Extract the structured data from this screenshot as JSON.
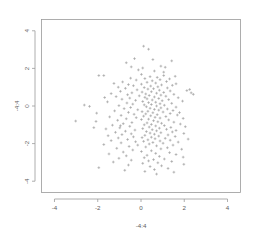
{
  "chart_data": {
    "type": "scatter",
    "title": "",
    "xlabel": "-4:4",
    "ylabel": "-4:4",
    "xlim": [
      -4.6,
      4.6
    ],
    "ylim": [
      -4.6,
      4.6
    ],
    "grid": false,
    "legend": null,
    "xticks": [
      -4,
      -2,
      0,
      2,
      4
    ],
    "xtick_labels": [
      "-4",
      "-2",
      "0",
      "2",
      "4"
    ],
    "yticks": [
      -4,
      -2,
      0,
      2,
      4
    ],
    "ytick_labels": [
      "-4",
      "-2",
      "0",
      "2",
      "4"
    ],
    "marker": "plus",
    "marker_color": "#9b9b9b",
    "n_points": 240,
    "points": [
      [
        0.12,
        3.18
      ],
      [
        0.35,
        3.02
      ],
      [
        -0.3,
        2.52
      ],
      [
        0.55,
        2.47
      ],
      [
        1.42,
        2.4
      ],
      [
        -0.68,
        2.3
      ],
      [
        0.92,
        2.12
      ],
      [
        1.12,
        2.06
      ],
      [
        0.08,
        2.02
      ],
      [
        -0.12,
        1.92
      ],
      [
        0.62,
        1.86
      ],
      [
        1.05,
        1.8
      ],
      [
        -1.95,
        1.62
      ],
      [
        -1.72,
        1.62
      ],
      [
        1.58,
        1.58
      ],
      [
        0.42,
        1.56
      ],
      [
        0.75,
        1.52
      ],
      [
        -0.48,
        1.48
      ],
      [
        0.18,
        1.46
      ],
      [
        1.32,
        1.44
      ],
      [
        0.88,
        1.4
      ],
      [
        -0.22,
        1.38
      ],
      [
        0.52,
        1.34
      ],
      [
        1.18,
        1.3
      ],
      [
        -0.85,
        1.28
      ],
      [
        0.28,
        1.26
      ],
      [
        0.68,
        1.22
      ],
      [
        -1.25,
        1.2
      ],
      [
        1.62,
        1.18
      ],
      [
        0.02,
        1.16
      ],
      [
        -0.58,
        1.14
      ],
      [
        0.95,
        1.12
      ],
      [
        1.45,
        1.1
      ],
      [
        -0.35,
        1.08
      ],
      [
        0.45,
        1.06
      ],
      [
        0.78,
        1.02
      ],
      [
        -1.05,
        1.0
      ],
      [
        0.15,
        0.98
      ],
      [
        1.22,
        0.96
      ],
      [
        -0.72,
        0.94
      ],
      [
        0.58,
        0.92
      ],
      [
        0.32,
        0.9
      ],
      [
        2.25,
        0.88
      ],
      [
        2.12,
        0.82
      ],
      [
        -0.18,
        0.86
      ],
      [
        0.85,
        0.84
      ],
      [
        1.35,
        0.8
      ],
      [
        -0.95,
        0.78
      ],
      [
        0.48,
        0.76
      ],
      [
        0.05,
        0.74
      ],
      [
        1.05,
        0.72
      ],
      [
        -0.42,
        0.7
      ],
      [
        0.72,
        0.68
      ],
      [
        -1.38,
        0.66
      ],
      [
        0.22,
        0.64
      ],
      [
        1.52,
        0.62
      ],
      [
        -0.62,
        0.6
      ],
      [
        0.92,
        0.58
      ],
      [
        0.38,
        0.56
      ],
      [
        -0.08,
        0.54
      ],
      [
        1.15,
        0.52
      ],
      [
        -1.15,
        0.5
      ],
      [
        0.62,
        0.48
      ],
      [
        0.18,
        0.46
      ],
      [
        1.72,
        0.44
      ],
      [
        -0.52,
        0.42
      ],
      [
        0.82,
        0.4
      ],
      [
        0.28,
        0.38
      ],
      [
        -0.88,
        0.36
      ],
      [
        1.28,
        0.34
      ],
      [
        0.52,
        0.32
      ],
      [
        -0.25,
        0.3
      ],
      [
        0.98,
        0.28
      ],
      [
        1.92,
        0.26
      ],
      [
        0.08,
        0.24
      ],
      [
        -1.55,
        0.22
      ],
      [
        0.68,
        0.2
      ],
      [
        0.35,
        0.18
      ],
      [
        -0.65,
        0.16
      ],
      [
        1.42,
        0.14
      ],
      [
        0.88,
        0.12
      ],
      [
        -0.38,
        0.1
      ],
      [
        0.48,
        0.08
      ],
      [
        0.15,
        0.06
      ],
      [
        1.08,
        0.04
      ],
      [
        -1.02,
        0.02
      ],
      [
        0.72,
        0.0
      ],
      [
        -2.62,
        0.05
      ],
      [
        -2.38,
        -0.02
      ],
      [
        0.25,
        -0.04
      ],
      [
        1.62,
        -0.06
      ],
      [
        -0.48,
        -0.08
      ],
      [
        0.92,
        -0.1
      ],
      [
        0.42,
        -0.12
      ],
      [
        -0.78,
        -0.14
      ],
      [
        1.22,
        -0.16
      ],
      [
        0.62,
        -0.18
      ],
      [
        -0.15,
        -0.2
      ],
      [
        0.82,
        -0.22
      ],
      [
        1.48,
        -0.24
      ],
      [
        -1.22,
        -0.26
      ],
      [
        0.32,
        -0.28
      ],
      [
        0.05,
        -0.3
      ],
      [
        1.02,
        -0.32
      ],
      [
        -0.58,
        -0.34
      ],
      [
        0.55,
        -0.36
      ],
      [
        -2.05,
        -0.38
      ],
      [
        1.35,
        -0.4
      ],
      [
        0.22,
        -0.42
      ],
      [
        -0.32,
        -0.44
      ],
      [
        0.75,
        -0.46
      ],
      [
        1.68,
        -0.48
      ],
      [
        -0.92,
        -0.5
      ],
      [
        0.45,
        -0.52
      ],
      [
        0.12,
        -0.54
      ],
      [
        1.15,
        -0.56
      ],
      [
        -1.45,
        -0.58
      ],
      [
        0.65,
        -0.6
      ],
      [
        -0.22,
        -0.62
      ],
      [
        0.88,
        -0.64
      ],
      [
        1.95,
        -0.66
      ],
      [
        -0.68,
        -0.68
      ],
      [
        0.35,
        -0.7
      ],
      [
        0.02,
        -0.72
      ],
      [
        1.28,
        -0.74
      ],
      [
        -1.08,
        -0.76
      ],
      [
        0.58,
        -0.78
      ],
      [
        -3.02,
        -0.8
      ],
      [
        -2.08,
        -0.82
      ],
      [
        0.78,
        -0.84
      ],
      [
        1.52,
        -0.86
      ],
      [
        -0.42,
        -0.88
      ],
      [
        0.28,
        -0.9
      ],
      [
        0.95,
        -0.92
      ],
      [
        -0.82,
        -0.94
      ],
      [
        1.82,
        -0.96
      ],
      [
        0.48,
        -0.98
      ],
      [
        0.15,
        -1.0
      ],
      [
        -1.32,
        -1.02
      ],
      [
        1.08,
        -1.04
      ],
      [
        0.68,
        -1.06
      ],
      [
        -0.52,
        -1.08
      ],
      [
        2.05,
        -1.1
      ],
      [
        0.38,
        -1.12
      ],
      [
        1.38,
        -1.14
      ],
      [
        -0.98,
        -1.16
      ],
      [
        0.85,
        -1.18
      ],
      [
        0.08,
        -1.2
      ],
      [
        -1.62,
        -1.22
      ],
      [
        1.18,
        -1.24
      ],
      [
        0.52,
        -1.26
      ],
      [
        -0.28,
        -1.28
      ],
      [
        1.62,
        -1.3
      ],
      [
        0.72,
        -1.32
      ],
      [
        -0.72,
        -1.34
      ],
      [
        0.25,
        -1.36
      ],
      [
        1.45,
        -1.38
      ],
      [
        -1.18,
        -1.4
      ],
      [
        0.92,
        -1.42
      ],
      [
        0.42,
        -1.44
      ],
      [
        1.98,
        -1.46
      ],
      [
        -0.45,
        -1.48
      ],
      [
        0.62,
        -1.5
      ],
      [
        -0.88,
        -1.52
      ],
      [
        1.25,
        -1.54
      ],
      [
        0.18,
        -1.56
      ],
      [
        -1.52,
        -1.58
      ],
      [
        0.82,
        -1.6
      ],
      [
        1.58,
        -1.62
      ],
      [
        -0.35,
        -1.64
      ],
      [
        0.48,
        -1.66
      ],
      [
        0.05,
        -1.68
      ],
      [
        -1.05,
        -1.7
      ],
      [
        1.12,
        -1.72
      ],
      [
        0.65,
        -1.74
      ],
      [
        2.18,
        -1.76
      ],
      [
        -0.62,
        -1.78
      ],
      [
        0.32,
        -1.8
      ],
      [
        1.35,
        -1.82
      ],
      [
        -1.38,
        -1.84
      ],
      [
        0.88,
        -1.86
      ],
      [
        0.12,
        -1.88
      ],
      [
        -0.25,
        -1.9
      ],
      [
        1.72,
        -1.92
      ],
      [
        0.55,
        -1.94
      ],
      [
        -0.92,
        -1.96
      ],
      [
        1.02,
        -1.98
      ],
      [
        0.38,
        -2.02
      ],
      [
        -1.72,
        -2.05
      ],
      [
        1.48,
        -2.08
      ],
      [
        0.72,
        -2.12
      ],
      [
        -0.55,
        -2.15
      ],
      [
        0.22,
        -2.18
      ],
      [
        1.22,
        -2.22
      ],
      [
        -1.12,
        -2.25
      ],
      [
        0.92,
        -2.28
      ],
      [
        1.88,
        -2.3
      ],
      [
        -0.38,
        -2.34
      ],
      [
        0.48,
        -2.38
      ],
      [
        0.02,
        -2.42
      ],
      [
        -0.82,
        -2.45
      ],
      [
        1.32,
        -2.48
      ],
      [
        0.68,
        -2.52
      ],
      [
        -1.48,
        -2.55
      ],
      [
        1.62,
        -2.58
      ],
      [
        0.28,
        -2.62
      ],
      [
        -0.68,
        -2.65
      ],
      [
        0.85,
        -2.68
      ],
      [
        1.95,
        -2.72
      ],
      [
        0.15,
        -2.75
      ],
      [
        -1.02,
        -2.78
      ],
      [
        1.08,
        -2.82
      ],
      [
        0.58,
        -2.85
      ],
      [
        -0.45,
        -2.88
      ],
      [
        0.35,
        -2.92
      ],
      [
        1.42,
        -2.95
      ],
      [
        -1.28,
        -2.98
      ],
      [
        0.78,
        -3.02
      ],
      [
        0.08,
        -3.05
      ],
      [
        1.98,
        -3.1
      ],
      [
        -0.58,
        -3.14
      ],
      [
        0.95,
        -3.18
      ],
      [
        0.42,
        -3.22
      ],
      [
        -1.95,
        -3.28
      ],
      [
        1.25,
        -3.32
      ],
      [
        0.62,
        -3.38
      ],
      [
        -0.75,
        -3.42
      ],
      [
        0.18,
        -3.48
      ],
      [
        1.52,
        -3.52
      ],
      [
        -0.95,
        -1.05
      ],
      [
        1.78,
        -0.35
      ],
      [
        -1.68,
        0.45
      ],
      [
        2.32,
        0.7
      ],
      [
        -2.18,
        -1.15
      ],
      [
        0.02,
        1.68
      ],
      [
        -0.15,
        -2.08
      ],
      [
        1.05,
        1.62
      ],
      [
        -0.45,
        2.08
      ],
      [
        0.72,
        -3.62
      ],
      [
        2.42,
        0.62
      ]
    ]
  }
}
